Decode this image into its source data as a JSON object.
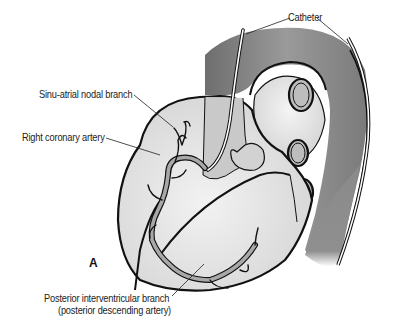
{
  "figure": {
    "panel_letter": "A"
  },
  "labels": {
    "catheter": "Catheter",
    "sinu_atrial": "Sinu-atrial nodal branch",
    "right_coronary": "Right coronary artery",
    "posterior_interventricular_line1": "Posterior interventricular branch",
    "posterior_interventricular_line2": "(posterior descending artery)"
  },
  "colors": {
    "heart_fill": "#e6e6e6",
    "aorta_fill": "#8a8a8a",
    "artery_fill": "#a8a8a8",
    "outline": "#111111",
    "catheter": "#ffffff"
  }
}
